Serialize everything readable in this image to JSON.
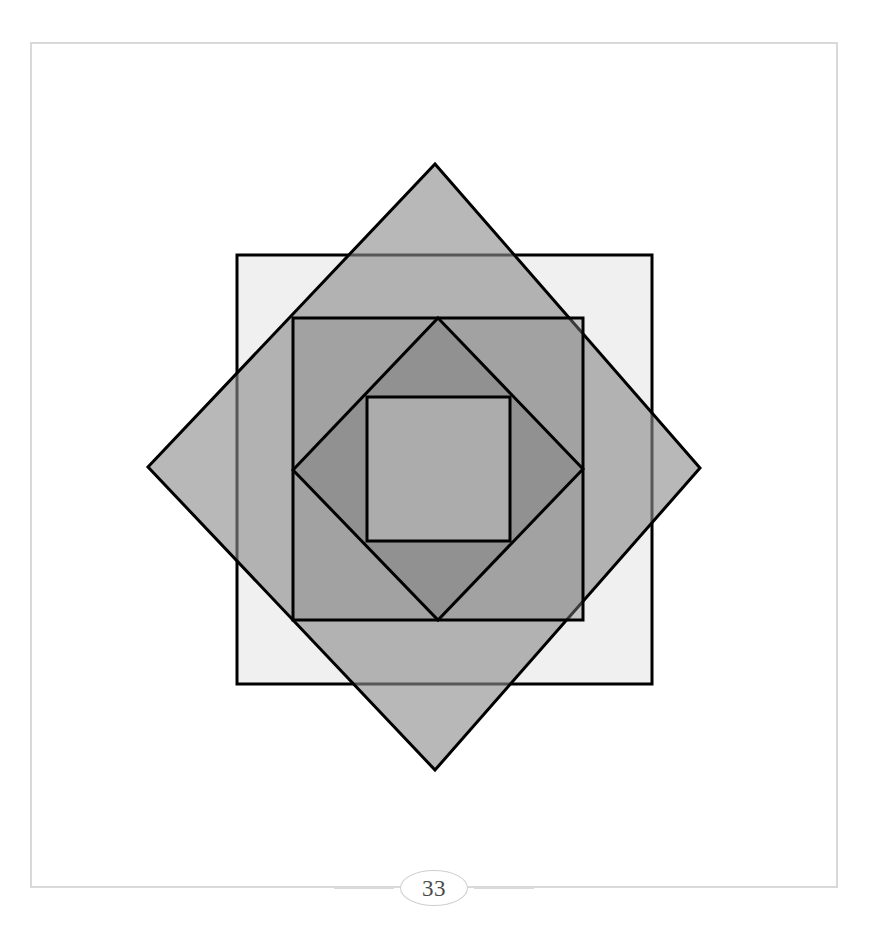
{
  "page": {
    "number": "33",
    "background_color": "#ffffff",
    "frame_color": "#d9d9d9",
    "footer_rule_color": "#d9d9d9"
  },
  "figure": {
    "name": "nested-rotated-squares",
    "center": {
      "x": 424,
      "y": 467
    },
    "stroke_color": "#000000",
    "stroke_width": 3,
    "shapes": [
      {
        "id": "square-outer",
        "label": "outermost axis-aligned square",
        "orientation": "axis-aligned",
        "rotation_deg": 0,
        "fill": "#f0f0f0",
        "opacity": 1,
        "points": "237,255 652,255 652,684 237,684"
      },
      {
        "id": "diamond-outer",
        "label": "large square rotated 45 degrees",
        "orientation": "rotated",
        "rotation_deg": 45,
        "fill": "#8c8c8c",
        "opacity": 0.62,
        "points": "435,164 700,468 435,770 148,467"
      },
      {
        "id": "square-middle",
        "label": "middle axis-aligned square",
        "orientation": "axis-aligned",
        "rotation_deg": 0,
        "fill": "#8c8c8c",
        "opacity": 0.42,
        "points": "293,318 583,318 583,620 293,620"
      },
      {
        "id": "diamond-inner",
        "label": "small square rotated 45 degrees",
        "orientation": "rotated",
        "rotation_deg": 45,
        "fill": "#7a7a7a",
        "opacity": 0.42,
        "points": "438,318 583,469 438,620 293,470"
      },
      {
        "id": "square-innermost",
        "label": "innermost axis-aligned square",
        "orientation": "axis-aligned",
        "rotation_deg": 0,
        "fill": "#c8c8c8",
        "opacity": 0.5,
        "points": "367,397 510,397 510,541 367,541"
      }
    ]
  }
}
